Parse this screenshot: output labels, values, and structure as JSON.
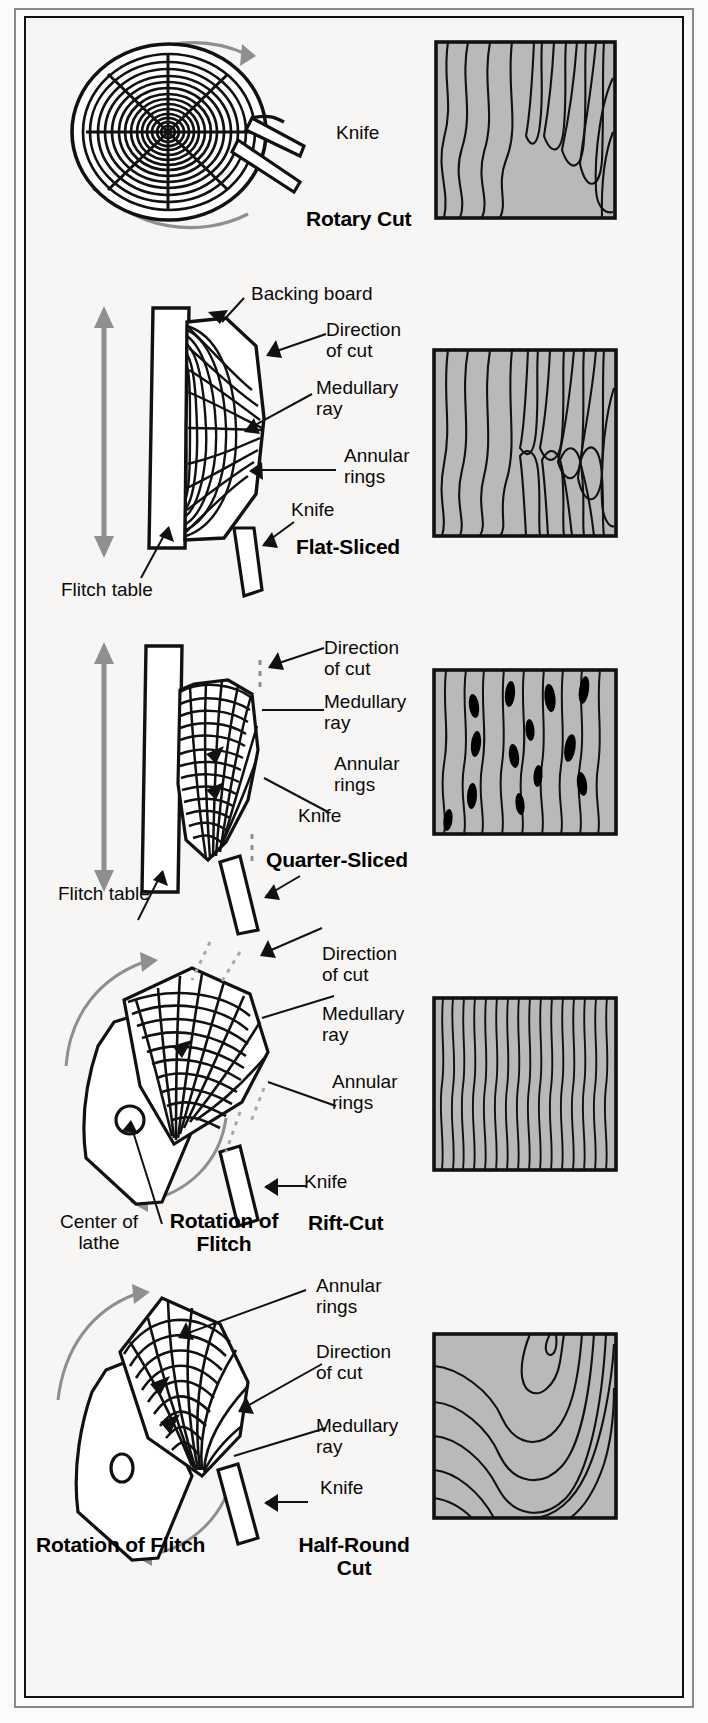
{
  "diagram": {
    "colors": {
      "veneer_fill": "#b9b9b9",
      "grain_line": "#111111",
      "ink": "#0a0a0a",
      "rotation_arrow": "#8f8f8f",
      "page_bg": "#f7f6f4",
      "frame_outer": "#8a8a8a",
      "frame_inner": "#111111",
      "fleck": "#000000"
    },
    "sections": [
      {
        "id": "rotary",
        "title": "Rotary Cut",
        "labels": [
          {
            "name": "knife",
            "text": "Knife"
          }
        ],
        "icons": [
          "log-cross-section-icon",
          "rotation-arrow-icon",
          "knife-icon",
          "veneer-sheet-icon"
        ],
        "grain": "broad cathedral / wild swirling figure"
      },
      {
        "id": "flat-sliced",
        "title": "Flat-Sliced",
        "labels": [
          {
            "name": "backing-board",
            "text": "Backing board"
          },
          {
            "name": "direction-of-cut",
            "text": "Direction\nof cut"
          },
          {
            "name": "medullary-ray",
            "text": "Medullary\nray"
          },
          {
            "name": "annular-rings",
            "text": "Annular\nrings"
          },
          {
            "name": "knife",
            "text": "Knife"
          },
          {
            "name": "flitch-table",
            "text": "Flitch table"
          }
        ],
        "icons": [
          "flitch-table-icon",
          "half-log-icon",
          "knife-icon",
          "up-down-arrow-icon",
          "veneer-sheet-icon"
        ],
        "grain": "cathedral figure, mirrored V at center"
      },
      {
        "id": "quarter-sliced",
        "title": "Quarter-Sliced",
        "labels": [
          {
            "name": "direction-of-cut",
            "text": "Direction\nof cut"
          },
          {
            "name": "medullary-ray",
            "text": "Medullary\nray"
          },
          {
            "name": "annular-rings",
            "text": "Annular\nrings"
          },
          {
            "name": "knife",
            "text": "Knife"
          },
          {
            "name": "flitch-table",
            "text": "Flitch table"
          }
        ],
        "icons": [
          "flitch-table-icon",
          "quarter-log-icon",
          "knife-icon",
          "up-down-arrow-icon",
          "veneer-sheet-icon"
        ],
        "grain": "straight vertical stripe with dark ray flecks"
      },
      {
        "id": "rift-cut",
        "title": "Rift-Cut",
        "labels": [
          {
            "name": "direction-of-cut",
            "text": "Direction\nof cut"
          },
          {
            "name": "medullary-ray",
            "text": "Medullary\nray"
          },
          {
            "name": "annular-rings",
            "text": "Annular\nrings"
          },
          {
            "name": "knife",
            "text": "Knife"
          },
          {
            "name": "center-of-lathe",
            "text": "Center of\nlathe"
          },
          {
            "name": "rotation-of-flitch",
            "text": "Rotation of\nFlitch"
          }
        ],
        "icons": [
          "lathe-icon",
          "quarter-flitch-icon",
          "knife-icon",
          "rotation-arrow-icon",
          "veneer-sheet-icon"
        ],
        "grain": "tight straight vertical stripe, no flecks"
      },
      {
        "id": "half-round",
        "title": "Half-Round\nCut",
        "labels": [
          {
            "name": "annular-rings",
            "text": "Annular\nrings"
          },
          {
            "name": "direction-of-cut",
            "text": "Direction\nof cut"
          },
          {
            "name": "medullary-ray",
            "text": "Medullary\nray"
          },
          {
            "name": "knife",
            "text": "Knife"
          },
          {
            "name": "rotation-of-flitch",
            "text": "Rotation of Flitch"
          }
        ],
        "icons": [
          "lathe-icon",
          "half-flitch-icon",
          "knife-icon",
          "rotation-arrow-icon",
          "veneer-sheet-icon"
        ],
        "grain": "wide sweeping arcs / half-round figure"
      }
    ]
  }
}
